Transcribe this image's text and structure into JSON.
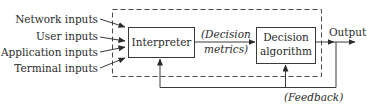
{
  "diagram": {
    "inputs": [
      {
        "label": "Network inputs"
      },
      {
        "label": "User inputs"
      },
      {
        "label": "Application inputs"
      },
      {
        "label": "Terminal inputs"
      }
    ],
    "blocks": {
      "interpreter": {
        "label": "Interpreter"
      },
      "decision_algorithm": {
        "line1": "Decision",
        "line2": "algorithm"
      }
    },
    "edge_labels": {
      "decision_metrics_line1": "(Decision",
      "decision_metrics_line2": "metrics)",
      "output": "Output",
      "feedback": "(Feedback)"
    },
    "colors": {
      "stroke": "#3a3a3a",
      "text": "#2b2b2b",
      "background": "#ffffff"
    }
  }
}
